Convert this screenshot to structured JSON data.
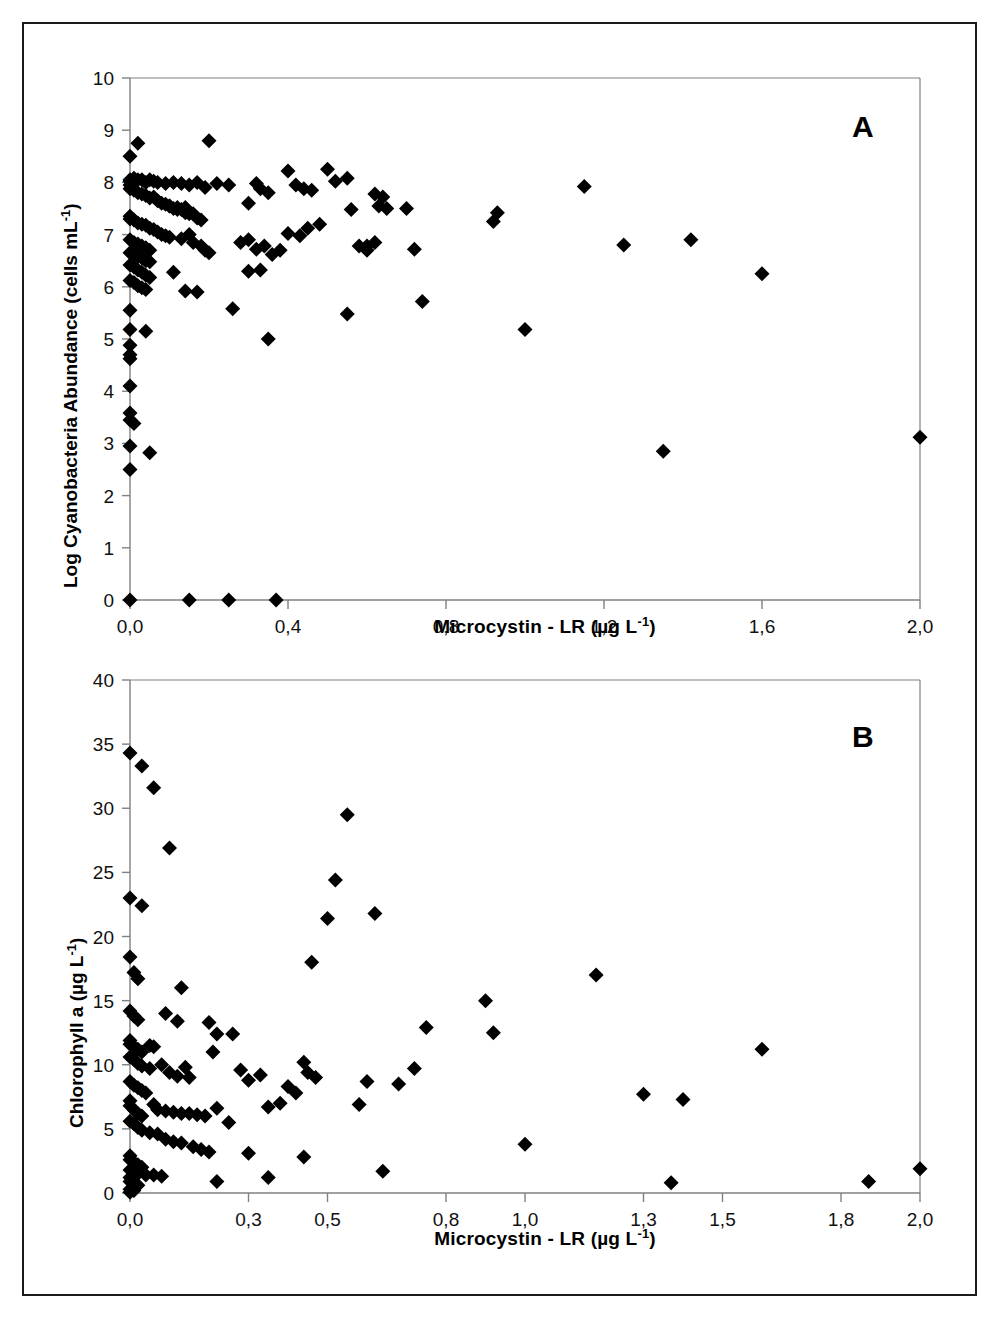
{
  "figure": {
    "background": "#ffffff",
    "marker_color": "#000000",
    "axis_color": "#808080",
    "frame_color": "#1a1a1a"
  },
  "chart_data": [
    {
      "type": "scatter",
      "panel_label": "A",
      "title": "",
      "xlabel": "Microcystin - LR (µg L-1)",
      "xlabel_parts": {
        "main": "Microcystin - LR (µg L",
        "sup": "-1",
        "tail": ")"
      },
      "ylabel": "Log Cyanobacteria Abundance (cells mL-1)",
      "ylabel_parts": {
        "main": "Log Cyanobacteria Abundance (cells mL",
        "sup": "-1",
        "tail": ")"
      },
      "xlim": [
        0,
        2.0
      ],
      "ylim": [
        0,
        10
      ],
      "xticks": [
        0,
        0.4,
        0.8,
        1.2,
        1.6,
        2.0
      ],
      "xtick_labels": [
        "0,0",
        "0,4",
        "0,8",
        "1,2",
        "1,6",
        "2,0"
      ],
      "yticks": [
        0,
        1,
        2,
        3,
        4,
        5,
        6,
        7,
        8,
        9,
        10
      ],
      "ytick_labels": [
        "0",
        "1",
        "2",
        "3",
        "4",
        "5",
        "6",
        "7",
        "8",
        "9",
        "10"
      ],
      "grid": false,
      "legend": false,
      "marker": "diamond",
      "points": [
        [
          0.0,
          8.5
        ],
        [
          0.02,
          8.75
        ],
        [
          0.2,
          8.8
        ],
        [
          0.0,
          8.05
        ],
        [
          0.0,
          8.02
        ],
        [
          0.01,
          8.08
        ],
        [
          0.02,
          8.05
        ],
        [
          0.03,
          8.05
        ],
        [
          0.04,
          8.0
        ],
        [
          0.05,
          8.05
        ],
        [
          0.06,
          8.02
        ],
        [
          0.07,
          8.0
        ],
        [
          0.09,
          7.98
        ],
        [
          0.11,
          8.0
        ],
        [
          0.13,
          7.98
        ],
        [
          0.15,
          7.95
        ],
        [
          0.17,
          8.0
        ],
        [
          0.19,
          7.9
        ],
        [
          0.22,
          7.98
        ],
        [
          0.25,
          7.95
        ],
        [
          0.0,
          7.95
        ],
        [
          0.0,
          7.88
        ],
        [
          0.01,
          7.85
        ],
        [
          0.02,
          7.8
        ],
        [
          0.03,
          7.78
        ],
        [
          0.04,
          7.75
        ],
        [
          0.05,
          7.7
        ],
        [
          0.06,
          7.72
        ],
        [
          0.07,
          7.65
        ],
        [
          0.08,
          7.6
        ],
        [
          0.09,
          7.58
        ],
        [
          0.1,
          7.55
        ],
        [
          0.11,
          7.5
        ],
        [
          0.12,
          7.52
        ],
        [
          0.13,
          7.48
        ],
        [
          0.14,
          7.42
        ],
        [
          0.15,
          7.4
        ],
        [
          0.0,
          7.35
        ],
        [
          0.0,
          7.3
        ],
        [
          0.01,
          7.28
        ],
        [
          0.02,
          7.22
        ],
        [
          0.03,
          7.2
        ],
        [
          0.04,
          7.18
        ],
        [
          0.05,
          7.12
        ],
        [
          0.06,
          7.1
        ],
        [
          0.07,
          7.05
        ],
        [
          0.08,
          7.0
        ],
        [
          0.09,
          6.98
        ],
        [
          0.1,
          6.95
        ],
        [
          0.0,
          6.9
        ],
        [
          0.01,
          6.85
        ],
        [
          0.02,
          6.82
        ],
        [
          0.03,
          6.78
        ],
        [
          0.04,
          6.75
        ],
        [
          0.05,
          6.7
        ],
        [
          0.0,
          6.65
        ],
        [
          0.01,
          6.62
        ],
        [
          0.02,
          6.58
        ],
        [
          0.03,
          6.55
        ],
        [
          0.04,
          6.5
        ],
        [
          0.05,
          6.48
        ],
        [
          0.0,
          6.42
        ],
        [
          0.01,
          6.38
        ],
        [
          0.02,
          6.32
        ],
        [
          0.03,
          6.28
        ],
        [
          0.04,
          6.22
        ],
        [
          0.05,
          6.18
        ],
        [
          0.0,
          6.12
        ],
        [
          0.01,
          6.08
        ],
        [
          0.02,
          6.02
        ],
        [
          0.03,
          5.98
        ],
        [
          0.04,
          5.95
        ],
        [
          0.0,
          5.55
        ],
        [
          0.0,
          5.18
        ],
        [
          0.04,
          5.15
        ],
        [
          0.0,
          4.88
        ],
        [
          0.0,
          4.7
        ],
        [
          0.0,
          4.62
        ],
        [
          0.0,
          4.1
        ],
        [
          0.0,
          3.58
        ],
        [
          0.0,
          3.45
        ],
        [
          0.01,
          3.38
        ],
        [
          0.0,
          2.95
        ],
        [
          0.05,
          2.82
        ],
        [
          0.0,
          2.5
        ],
        [
          0.1,
          7.55
        ],
        [
          0.12,
          7.48
        ],
        [
          0.14,
          7.52
        ],
        [
          0.16,
          7.4
        ],
        [
          0.17,
          7.32
        ],
        [
          0.18,
          7.28
        ],
        [
          0.15,
          7.0
        ],
        [
          0.13,
          6.92
        ],
        [
          0.16,
          6.85
        ],
        [
          0.18,
          6.78
        ],
        [
          0.19,
          6.7
        ],
        [
          0.2,
          6.65
        ],
        [
          0.11,
          6.28
        ],
        [
          0.14,
          5.92
        ],
        [
          0.17,
          5.9
        ],
        [
          0.26,
          5.58
        ],
        [
          0.3,
          7.6
        ],
        [
          0.32,
          7.98
        ],
        [
          0.33,
          7.88
        ],
        [
          0.35,
          7.8
        ],
        [
          0.28,
          6.85
        ],
        [
          0.3,
          6.9
        ],
        [
          0.32,
          6.72
        ],
        [
          0.34,
          6.78
        ],
        [
          0.36,
          6.62
        ],
        [
          0.38,
          6.7
        ],
        [
          0.3,
          6.3
        ],
        [
          0.33,
          6.32
        ],
        [
          0.35,
          5.0
        ],
        [
          0.4,
          8.22
        ],
        [
          0.42,
          7.95
        ],
        [
          0.44,
          7.88
        ],
        [
          0.46,
          7.85
        ],
        [
          0.4,
          7.02
        ],
        [
          0.43,
          6.98
        ],
        [
          0.45,
          7.12
        ],
        [
          0.48,
          7.2
        ],
        [
          0.5,
          8.25
        ],
        [
          0.52,
          8.02
        ],
        [
          0.55,
          8.08
        ],
        [
          0.56,
          7.48
        ],
        [
          0.58,
          6.78
        ],
        [
          0.6,
          6.7
        ],
        [
          0.62,
          7.78
        ],
        [
          0.63,
          7.55
        ],
        [
          0.64,
          7.72
        ],
        [
          0.65,
          7.5
        ],
        [
          0.55,
          5.48
        ],
        [
          0.6,
          6.78
        ],
        [
          0.62,
          6.85
        ],
        [
          0.7,
          7.5
        ],
        [
          0.72,
          6.72
        ],
        [
          0.74,
          5.72
        ],
        [
          0.92,
          7.25
        ],
        [
          0.93,
          7.42
        ],
        [
          1.0,
          5.18
        ],
        [
          1.15,
          7.92
        ],
        [
          1.25,
          6.8
        ],
        [
          1.35,
          2.85
        ],
        [
          1.42,
          6.9
        ],
        [
          1.6,
          6.25
        ],
        [
          2.0,
          3.12
        ],
        [
          0.0,
          0.0
        ],
        [
          0.15,
          0.0
        ],
        [
          0.25,
          0.0
        ],
        [
          0.37,
          0.0
        ]
      ]
    },
    {
      "type": "scatter",
      "panel_label": "B",
      "title": "",
      "xlabel": "Microcystin - LR (µg L-1)",
      "xlabel_parts": {
        "main": "Microcystin - LR (µg L",
        "sup": "-1",
        "tail": ")"
      },
      "ylabel": "Chlorophyll a (µg L-1)",
      "ylabel_parts": {
        "main": "Chlorophyll a (µg L",
        "sup": "-1",
        "tail": ")"
      },
      "xlim": [
        0,
        2.0
      ],
      "ylim": [
        0,
        40
      ],
      "xticks": [
        0,
        0.3,
        0.5,
        0.8,
        1.0,
        1.3,
        1.5,
        1.8,
        2.0
      ],
      "xtick_labels": [
        "0,0",
        "0,3",
        "0,5",
        "0,8",
        "1,0",
        "1,3",
        "1,5",
        "1,8",
        "2,0"
      ],
      "yticks": [
        0,
        5,
        10,
        15,
        20,
        25,
        30,
        35,
        40
      ],
      "ytick_labels": [
        "0",
        "5",
        "10",
        "15",
        "20",
        "25",
        "30",
        "35",
        "40"
      ],
      "grid": false,
      "legend": false,
      "marker": "diamond",
      "points": [
        [
          0.0,
          34.3
        ],
        [
          0.03,
          33.3
        ],
        [
          0.06,
          31.6
        ],
        [
          0.1,
          26.9
        ],
        [
          0.55,
          29.5
        ],
        [
          0.0,
          23.0
        ],
        [
          0.03,
          22.4
        ],
        [
          0.52,
          24.4
        ],
        [
          0.5,
          21.4
        ],
        [
          0.62,
          21.8
        ],
        [
          0.0,
          18.4
        ],
        [
          0.01,
          17.2
        ],
        [
          0.02,
          16.7
        ],
        [
          0.46,
          18.0
        ],
        [
          1.18,
          17.0
        ],
        [
          0.0,
          14.2
        ],
        [
          0.01,
          13.8
        ],
        [
          0.02,
          13.5
        ],
        [
          0.12,
          13.4
        ],
        [
          0.09,
          14.0
        ],
        [
          0.2,
          13.3
        ],
        [
          0.22,
          12.4
        ],
        [
          0.26,
          12.4
        ],
        [
          0.9,
          15.0
        ],
        [
          0.92,
          12.5
        ],
        [
          0.75,
          12.9
        ],
        [
          0.0,
          11.9
        ],
        [
          0.0,
          11.6
        ],
        [
          0.01,
          11.4
        ],
        [
          0.02,
          11.2
        ],
        [
          0.03,
          11.0
        ],
        [
          0.05,
          11.5
        ],
        [
          0.06,
          11.4
        ],
        [
          0.13,
          16.0
        ],
        [
          0.21,
          11.0
        ],
        [
          1.6,
          11.2
        ],
        [
          0.0,
          10.6
        ],
        [
          0.01,
          10.4
        ],
        [
          0.02,
          10.1
        ],
        [
          0.03,
          9.9
        ],
        [
          0.05,
          9.7
        ],
        [
          0.08,
          10.0
        ],
        [
          0.1,
          9.4
        ],
        [
          0.12,
          9.1
        ],
        [
          0.14,
          9.8
        ],
        [
          0.15,
          9.0
        ],
        [
          0.28,
          9.6
        ],
        [
          0.3,
          8.8
        ],
        [
          0.33,
          9.2
        ],
        [
          0.4,
          8.3
        ],
        [
          0.44,
          10.2
        ],
        [
          0.0,
          8.7
        ],
        [
          0.01,
          8.4
        ],
        [
          0.02,
          8.2
        ],
        [
          0.03,
          8.0
        ],
        [
          0.04,
          7.8
        ],
        [
          0.06,
          6.9
        ],
        [
          0.07,
          6.5
        ],
        [
          0.09,
          6.4
        ],
        [
          0.11,
          6.3
        ],
        [
          0.13,
          6.2
        ],
        [
          0.15,
          6.2
        ],
        [
          0.17,
          6.1
        ],
        [
          0.19,
          6.0
        ],
        [
          0.22,
          6.6
        ],
        [
          0.25,
          5.5
        ],
        [
          0.35,
          6.7
        ],
        [
          0.38,
          7.0
        ],
        [
          0.42,
          7.8
        ],
        [
          0.45,
          9.4
        ],
        [
          0.47,
          9.0
        ],
        [
          0.58,
          6.9
        ],
        [
          0.6,
          8.7
        ],
        [
          0.68,
          8.5
        ],
        [
          0.72,
          9.7
        ],
        [
          0.0,
          7.2
        ],
        [
          0.0,
          6.8
        ],
        [
          0.01,
          6.5
        ],
        [
          0.02,
          6.2
        ],
        [
          0.03,
          6.0
        ],
        [
          0.0,
          5.6
        ],
        [
          0.01,
          5.4
        ],
        [
          0.02,
          5.1
        ],
        [
          0.03,
          4.9
        ],
        [
          0.05,
          4.7
        ],
        [
          0.07,
          4.6
        ],
        [
          0.09,
          4.2
        ],
        [
          0.11,
          4.0
        ],
        [
          0.13,
          3.9
        ],
        [
          0.16,
          3.6
        ],
        [
          0.18,
          3.4
        ],
        [
          0.2,
          3.2
        ],
        [
          0.3,
          3.1
        ],
        [
          0.35,
          1.2
        ],
        [
          0.44,
          2.8
        ],
        [
          1.0,
          3.8
        ],
        [
          1.3,
          7.7
        ],
        [
          1.4,
          7.3
        ],
        [
          0.0,
          2.9
        ],
        [
          0.0,
          2.6
        ],
        [
          0.01,
          2.4
        ],
        [
          0.02,
          2.2
        ],
        [
          0.03,
          2.0
        ],
        [
          0.0,
          1.8
        ],
        [
          0.01,
          1.6
        ],
        [
          0.02,
          1.5
        ],
        [
          0.04,
          1.4
        ],
        [
          0.06,
          1.4
        ],
        [
          0.08,
          1.3
        ],
        [
          0.22,
          0.9
        ],
        [
          0.64,
          1.7
        ],
        [
          1.37,
          0.8
        ],
        [
          1.87,
          0.9
        ],
        [
          2.0,
          1.9
        ],
        [
          0.0,
          1.2
        ],
        [
          0.0,
          0.9
        ],
        [
          0.01,
          0.7
        ],
        [
          0.02,
          0.6
        ],
        [
          0.0,
          0.3
        ],
        [
          0.01,
          0.2
        ],
        [
          0.0,
          0.05
        ]
      ]
    }
  ]
}
